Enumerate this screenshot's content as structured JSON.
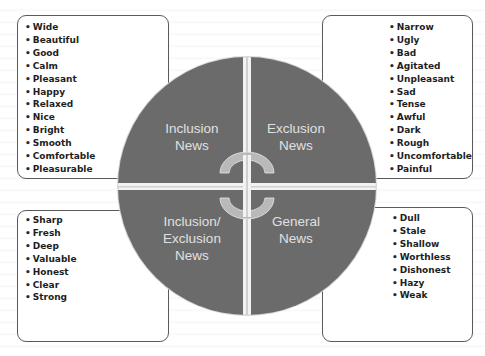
{
  "diagram": {
    "quadrants": [
      {
        "id": "tl",
        "label_lines": [
          "Inclusion",
          "News"
        ]
      },
      {
        "id": "tr",
        "label_lines": [
          "Exclusion",
          "News"
        ]
      },
      {
        "id": "bl",
        "label_lines": [
          "Inclusion/",
          "Exclusion",
          "News"
        ]
      },
      {
        "id": "br",
        "label_lines": [
          "General",
          "News"
        ]
      }
    ],
    "colors": {
      "quadrant_fill": "#6b6b6b",
      "separator": "#f2f2f2",
      "arrow_fill": "#b9b9b9",
      "label_text": "#e0e0e0",
      "box_border": "#5a5a5a"
    }
  },
  "word_boxes": {
    "top_left": [
      "Wide",
      "Beautiful",
      "Good",
      "Calm",
      "Pleasant",
      "Happy",
      "Relaxed",
      "Nice",
      "Bright",
      "Smooth",
      "Comfortable",
      "Pleasurable"
    ],
    "top_right": [
      "Narrow",
      "Ugly",
      "Bad",
      "Agitated",
      "Unpleasant",
      "Sad",
      "Tense",
      "Awful",
      "Dark",
      "Rough",
      "Uncomfortable",
      "Painful"
    ],
    "bottom_left": [
      "Sharp",
      "Fresh",
      "Deep",
      "Valuable",
      "Honest",
      "Clear",
      "Strong"
    ],
    "bottom_right": [
      "Dull",
      "Stale",
      "Shallow",
      "Worthless",
      "Dishonest",
      "Hazy",
      "Weak"
    ]
  }
}
